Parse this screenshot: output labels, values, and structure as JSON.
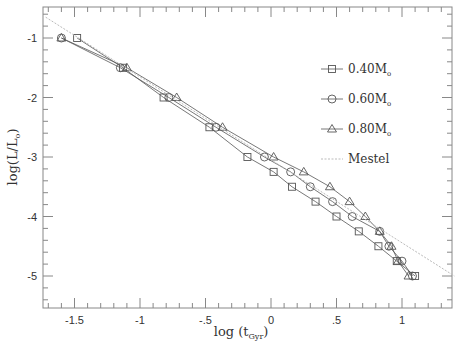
{
  "chart_data": {
    "type": "line",
    "title": "",
    "xlabel": "log (t_Gyr)",
    "ylabel": "log(L/L_o)",
    "xlim": [
      -1.75,
      1.38
    ],
    "ylim": [
      -5.5,
      -0.5
    ],
    "xticks": [
      -1.5,
      -1,
      -0.5,
      0,
      0.5,
      1
    ],
    "xtick_labels": [
      "-1.5",
      "-1",
      "-.5",
      "0",
      ".5",
      "1"
    ],
    "yticks": [
      -1,
      -2,
      -3,
      -4,
      -5
    ],
    "ytick_labels": [
      "-1",
      "-2",
      "-3",
      "-4",
      "-5"
    ],
    "grid": false,
    "legend_position": "upper right (inside)",
    "series": [
      {
        "name": "0.40M_o",
        "marker": "square",
        "x": [
          -1.48,
          -1.13,
          -0.82,
          -0.47,
          -0.18,
          0.02,
          0.16,
          0.34,
          0.5,
          0.67,
          0.82,
          0.96,
          1.1
        ],
        "y": [
          -1.0,
          -1.5,
          -2.0,
          -2.5,
          -3.0,
          -3.25,
          -3.5,
          -3.75,
          -4.0,
          -4.25,
          -4.5,
          -4.75,
          -5.0
        ]
      },
      {
        "name": "0.60M_o",
        "marker": "circle",
        "x": [
          -1.6,
          -1.15,
          -0.78,
          -0.42,
          -0.05,
          0.15,
          0.3,
          0.47,
          0.62,
          0.83,
          0.9,
          1.0,
          1.08
        ],
        "y": [
          -1.0,
          -1.5,
          -2.0,
          -2.5,
          -3.0,
          -3.25,
          -3.5,
          -3.75,
          -4.0,
          -4.25,
          -4.5,
          -4.75,
          -5.0
        ]
      },
      {
        "name": "0.80M_o",
        "marker": "triangle",
        "x": [
          -1.6,
          -1.1,
          -0.72,
          -0.37,
          0.02,
          0.25,
          0.45,
          0.6,
          0.72,
          0.83,
          0.92,
          0.97,
          1.05
        ],
        "y": [
          -1.0,
          -1.5,
          -2.0,
          -2.5,
          -3.0,
          -3.25,
          -3.5,
          -3.75,
          -4.0,
          -4.25,
          -4.5,
          -4.75,
          -5.0
        ]
      },
      {
        "name": "Mestel",
        "marker": "none",
        "style": "dotted",
        "x": [
          -1.72,
          1.4
        ],
        "y": [
          -0.65,
          -5.0
        ]
      }
    ]
  },
  "legend": {
    "items": [
      {
        "label": "0.40M",
        "sub": "o",
        "marker": "square"
      },
      {
        "label": "0.60M",
        "sub": "o",
        "marker": "circle"
      },
      {
        "label": "0.80M",
        "sub": "o",
        "marker": "triangle"
      },
      {
        "label": "Mestel",
        "sub": "",
        "marker": "dotted-line"
      }
    ]
  },
  "axes": {
    "xlabel_main": "log",
    "xlabel_sub": "Gyr",
    "ylabel_main": "log(L/L",
    "ylabel_sub": "o",
    "ylabel_close": ")"
  },
  "colors": {
    "line": "#555555",
    "marker": "#555555",
    "mestel": "#bbbbbb",
    "frame": "#888888"
  }
}
